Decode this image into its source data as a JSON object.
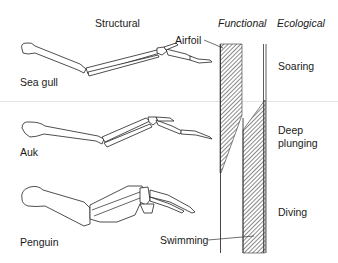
{
  "headers": {
    "structural": "Structural",
    "functional": "Functional",
    "ecological": "Ecological"
  },
  "birds": [
    {
      "name": "Sea gull",
      "wing": "seagull-wing"
    },
    {
      "name": "Auk",
      "wing": "auk-wing"
    },
    {
      "name": "Penguin",
      "wing": "penguin-wing"
    }
  ],
  "functional_labels": {
    "airfoil": "Airfoil",
    "swimming": "Swimming"
  },
  "ecological_labels": [
    {
      "line1": "Soaring",
      "line2": ""
    },
    {
      "line1": "Deep",
      "line2": "plunging"
    },
    {
      "line1": "Diving",
      "line2": ""
    }
  ],
  "colors": {
    "ink": "#1a1a1a",
    "hatch": "#555555",
    "separator": "#d9d9d9",
    "background": "#ffffff"
  }
}
